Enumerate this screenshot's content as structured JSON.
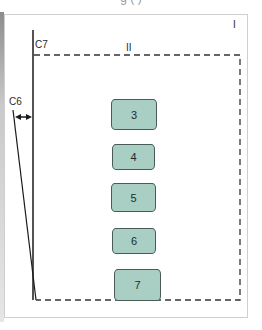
{
  "caption": {
    "text_partial": "g (       )"
  },
  "labels": {
    "region_outer": "I",
    "region_inner": "II",
    "c7": "C7",
    "c6": "C6"
  },
  "boxes": [
    {
      "label": "3",
      "x": 111,
      "y": 99,
      "w": 46,
      "h": 31
    },
    {
      "label": "4",
      "x": 112,
      "y": 144,
      "w": 43,
      "h": 26
    },
    {
      "label": "5",
      "x": 111,
      "y": 183,
      "w": 45,
      "h": 29
    },
    {
      "label": "6",
      "x": 112,
      "y": 228,
      "w": 44,
      "h": 26
    },
    {
      "label": "7",
      "x": 114,
      "y": 269,
      "w": 47,
      "h": 32
    }
  ],
  "colors": {
    "box_fill": "#a9cfc4",
    "box_border": "#4a5a55",
    "line": "#1a1a1a",
    "dash": "#333333"
  }
}
